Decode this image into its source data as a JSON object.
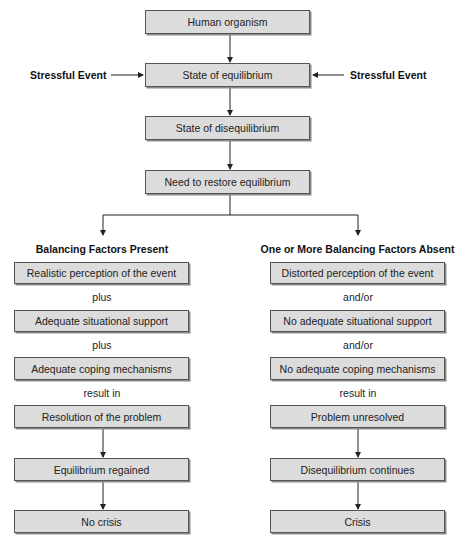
{
  "top": {
    "boxes": [
      "Human organism",
      "State of equilibrium",
      "State of disequilibrium",
      "Need to restore equilibrium"
    ],
    "side_labels": {
      "left": "Stressful Event",
      "right": "Stressful Event"
    }
  },
  "left_branch": {
    "heading": "Balancing Factors Present",
    "factors": [
      "Realistic perception of the event",
      "Adequate situational support",
      "Adequate coping mechanisms"
    ],
    "connectors": [
      "plus",
      "plus",
      "result in"
    ],
    "outcomes": [
      "Resolution of the problem",
      "Equilibrium regained",
      "No crisis"
    ]
  },
  "right_branch": {
    "heading": "One or More Balancing Factors Absent",
    "factors": [
      "Distorted perception of the event",
      "No adequate situational support",
      "No adequate coping mechanisms"
    ],
    "connectors": [
      "and/or",
      "and/or",
      "result in"
    ],
    "outcomes": [
      "Problem unresolved",
      "Disequilibrium continues",
      "Crisis"
    ]
  },
  "colors": {
    "box_fill": "#dcdcdc",
    "box_border": "#555555",
    "line": "#222222"
  }
}
